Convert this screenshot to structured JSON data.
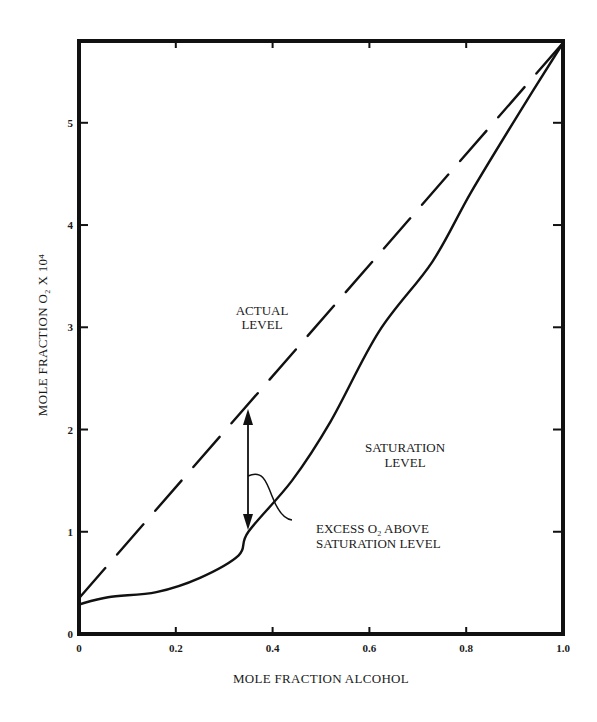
{
  "chart_data": {
    "type": "line",
    "title": "",
    "xlabel": "MOLE FRACTION ALCOHOL",
    "ylabel": "MOLE FRACTION O₂ X 10⁴",
    "xlim": [
      0,
      1.0
    ],
    "ylim": [
      0,
      5.8
    ],
    "grid": false,
    "legend": null,
    "x_ticks": [
      {
        "value": 0,
        "label": "0"
      },
      {
        "value": 0.2,
        "label": "0.2"
      },
      {
        "value": 0.4,
        "label": "0.4"
      },
      {
        "value": 0.6,
        "label": "0.6"
      },
      {
        "value": 0.8,
        "label": "0.8"
      },
      {
        "value": 1.0,
        "label": "1.0"
      }
    ],
    "y_ticks": [
      {
        "value": 0,
        "label": "0"
      },
      {
        "value": 1,
        "label": "1"
      },
      {
        "value": 2,
        "label": "2"
      },
      {
        "value": 3,
        "label": "3"
      },
      {
        "value": 4,
        "label": "4"
      },
      {
        "value": 5,
        "label": "5"
      }
    ],
    "series": [
      {
        "name": "Actual Level",
        "style": "dashed",
        "x": [
          0,
          1.0
        ],
        "values": [
          0.35,
          5.78
        ]
      },
      {
        "name": "Saturation Level",
        "style": "solid",
        "x": [
          0,
          0.06,
          0.16,
          0.25,
          0.33,
          0.35,
          0.44,
          0.52,
          0.62,
          0.73,
          0.81,
          0.91,
          1.0
        ],
        "values": [
          0.29,
          0.36,
          0.41,
          0.55,
          0.77,
          1.0,
          1.5,
          2.08,
          2.96,
          3.64,
          4.32,
          5.1,
          5.78
        ]
      }
    ],
    "annotations": [
      {
        "text_lines": [
          "ACTUAL",
          "LEVEL"
        ],
        "x": 0.36,
        "y": 2.95,
        "refers_to": "Actual Level"
      },
      {
        "text_lines": [
          "SATURATION",
          "LEVEL"
        ],
        "x": 0.66,
        "y": 1.78,
        "refers_to": "Saturation Level"
      },
      {
        "text_lines": [
          "EXCESS O₂ ABOVE",
          "SATURATION LEVEL"
        ],
        "x": 0.65,
        "y": 0.87,
        "refers_to": "double-arrow gap at x=0.35"
      },
      {
        "type": "double-arrow",
        "x": 0.35,
        "y_from": 1.0,
        "y_to": 2.2
      }
    ]
  },
  "labels": {
    "x_title": "MOLE FRACTION ALCOHOL",
    "y_title": "MOLE FRACTION O₂ X 10⁴",
    "actual_1": "ACTUAL",
    "actual_2": "LEVEL",
    "sat_1": "SATURATION",
    "sat_2": "LEVEL",
    "excess_1": "EXCESS O₂ ABOVE",
    "excess_2": "SATURATION LEVEL"
  },
  "colors": {
    "ink": "#111111",
    "background": "#ffffff"
  }
}
